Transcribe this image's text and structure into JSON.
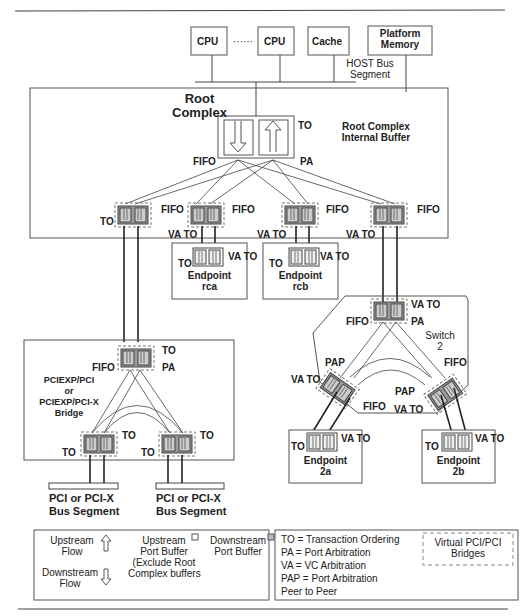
{
  "host": {
    "cpu1": "CPU",
    "dots": "······",
    "cpu2": "CPU",
    "cache": "Cache",
    "platform_memory": [
      "Platform",
      "Memory"
    ],
    "host_bus": [
      "HOST Bus",
      "Segment"
    ]
  },
  "root_complex": {
    "title": [
      "Root",
      "Complex"
    ],
    "internal_buffer": [
      "Root Complex",
      "Internal Buffer"
    ],
    "labels": {
      "to": "TO",
      "fifo": "FIFO",
      "pa": "PA"
    },
    "ports": [
      {
        "fifo": "FIFO",
        "left": "TO"
      },
      {
        "fifo": "FIFO",
        "below": "VA TO"
      },
      {
        "fifo": "FIFO",
        "below": "VA TO"
      },
      {
        "fifo": "FIFO",
        "below": "VA TO"
      }
    ]
  },
  "endpoints_rc": [
    {
      "name": [
        "Endpoint",
        "rca"
      ],
      "to": "TO",
      "vato": "VA TO"
    },
    {
      "name": [
        "Endpoint",
        "rcb"
      ],
      "to": "TO",
      "vato": "VA TO"
    }
  ],
  "bridge": {
    "title": [
      "PCIEXP/PCI",
      "or",
      "PCIEXP/PCI-X",
      "Bridge"
    ],
    "top": {
      "to": "TO",
      "fifo": "FIFO",
      "pa": "PA"
    },
    "ports": [
      {
        "left": "TO",
        "right": "TO"
      },
      {
        "left": "TO",
        "right": "TO"
      }
    ],
    "segments": [
      [
        "PCI or PCI-X",
        "Bus Segment"
      ],
      [
        "PCI or PCI-X",
        "Bus Segment"
      ]
    ]
  },
  "switch": {
    "title": [
      "Switch",
      "2"
    ],
    "top": {
      "vato": "VA TO",
      "fifo": "FIFO",
      "pa": "PA"
    },
    "left": {
      "pap": "PAP",
      "vato": "VA TO",
      "fifo": "FIFO"
    },
    "right": {
      "pap": "PAP",
      "vato": "VA TO",
      "fifo": "FIFO"
    }
  },
  "endpoints_sw": [
    {
      "name": [
        "Endpoint",
        "2a"
      ],
      "to": "TO",
      "vato": "VA TO"
    },
    {
      "name": [
        "Endpoint",
        "2b"
      ],
      "to": "TO",
      "vato": "VA TO"
    }
  ],
  "legend": {
    "upstream_flow": [
      "Upstream",
      "Flow"
    ],
    "downstream_flow": [
      "Downstream",
      "Flow"
    ],
    "upstream_port_buffer": [
      "Upstream",
      "Port Buffer",
      "(Exclude Root",
      "Complex buffers"
    ],
    "downstream_port_buffer": [
      "Downstream",
      "Port Buffer"
    ],
    "abbreviations": [
      "TO = Transaction Ordering",
      "PA = Port Arbitration",
      "VA = VC Arbitration",
      "PAP = Port Arbitration",
      "Peer to Peer"
    ],
    "virtual_bridges": [
      "Virtual PCI/PCI",
      "Bridges"
    ]
  },
  "colors": {
    "port_fill": "#9a9a9a",
    "line": "#333333",
    "border": "#555555"
  }
}
